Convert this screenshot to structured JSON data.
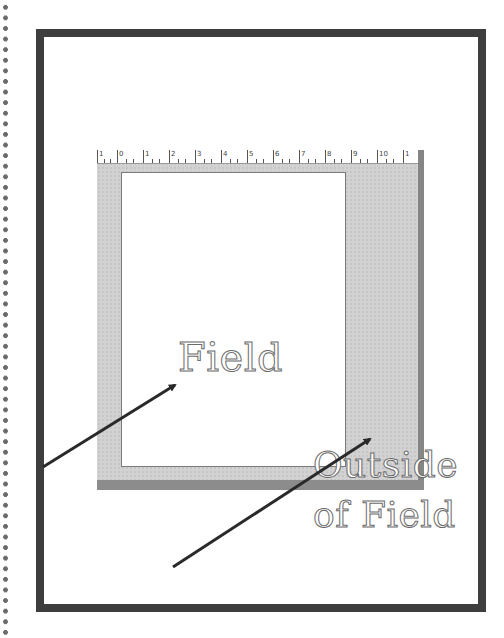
{
  "diagram": {
    "labels": {
      "field": "Field",
      "outside_line1": "Outside",
      "outside_line2": "of Field"
    },
    "ruler": {
      "numbers": [
        "1",
        "0",
        "1",
        "2",
        "3",
        "4",
        "5",
        "6",
        "7",
        "8",
        "9",
        "10",
        "1"
      ]
    },
    "arrows": [
      {
        "name": "arrow-to-field",
        "from": [
          43,
          467
        ],
        "to": [
          177,
          384
        ]
      },
      {
        "name": "arrow-to-outside",
        "from": [
          173,
          567
        ],
        "to": [
          372,
          438
        ]
      }
    ],
    "colors": {
      "frame": "#3e3e3e",
      "panel": "#d2d2d2",
      "panel_shadow": "#8c8c8c",
      "page": "#ffffff",
      "arrow": "#2a2a2a",
      "label_outline": "#6b6b6b"
    }
  }
}
